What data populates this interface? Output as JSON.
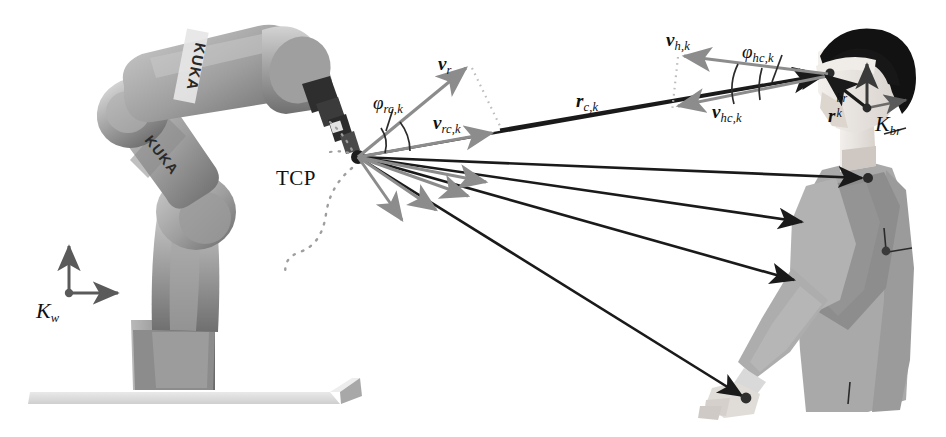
{
  "figure": {
    "background_color": "#ffffff"
  },
  "colors": {
    "black_vector": "#1a1a1a",
    "gray_vector": "#8c8c8c",
    "dotted_guide": "#b5b5b5",
    "robot_body": "#9a9a9a",
    "robot_body_light": "#c2c2c2",
    "robot_body_dark": "#6e6e6e",
    "robot_joint_black": "#2b2b2b",
    "platform": "#dcdcdc",
    "human_body": "#a8a8a8",
    "human_arm_dark": "#8a8a8a",
    "human_skin": "#e8e4e0",
    "human_hair": "#141414",
    "label_text": "#101010"
  },
  "labels": {
    "tcp": "TCP",
    "world_frame": "Κ",
    "world_frame_sub": "w",
    "body_frame": "Κ",
    "body_frame_sub": "br",
    "v_r": "v",
    "v_r_sub": "r",
    "v_rc": "v",
    "v_rc_sub": "rc,k",
    "phi_rc": "φ",
    "phi_rc_sub": "rc,k",
    "r_c": "r",
    "r_c_sub": "c,k",
    "v_h": "v",
    "v_h_sub": "h,k",
    "v_hc": "v",
    "v_hc_sub": "hc,k",
    "phi_hc": "φ",
    "phi_hc_sub": "hc,k",
    "r_k_br": "r",
    "r_k_br_sup": "br",
    "r_k_br_sub": "k",
    "kuka_upper": "KUKA",
    "kuka_lower": "KUKA"
  },
  "geometry": {
    "tcp_point": {
      "x": 358,
      "y": 157
    },
    "head_point": {
      "x": 830,
      "y": 73
    },
    "body_frame_origin": {
      "x": 867,
      "y": 108
    },
    "world_frame_origin": {
      "x": 69,
      "y": 293
    },
    "world_frame_x_tip": {
      "x": 124,
      "y": 293
    },
    "world_frame_y_tip": {
      "x": 69,
      "y": 240
    },
    "v_r_tip": {
      "x": 470,
      "y": 65
    },
    "v_rc_tip": {
      "x": 497,
      "y": 129
    },
    "v_h_tip": {
      "x": 678,
      "y": 57
    },
    "v_hc_tip": {
      "x": 672,
      "y": 108
    }
  },
  "rays": {
    "description": "Black distance vectors from robot TCP to human body keypoints, each overlaid with a short gray projected-velocity arrowhead",
    "targets": [
      {
        "name": "head",
        "x": 830,
        "y": 73
      },
      {
        "name": "shoulder",
        "x": 868,
        "y": 178
      },
      {
        "name": "upper-arm",
        "x": 808,
        "y": 222
      },
      {
        "name": "elbow",
        "x": 800,
        "y": 280
      },
      {
        "name": "hand",
        "x": 746,
        "y": 397
      }
    ],
    "gray_arrow_tips": [
      {
        "x": 497,
        "y": 129
      },
      {
        "x": 490,
        "y": 187
      },
      {
        "x": 472,
        "y": 199
      },
      {
        "x": 440,
        "y": 213
      },
      {
        "x": 405,
        "y": 223
      }
    ]
  },
  "kuka_robot": {
    "brand": "KUKA",
    "brand_occurrences": 2,
    "has_base": true,
    "has_platform": true,
    "tcp_trajectory_dotted": true
  }
}
